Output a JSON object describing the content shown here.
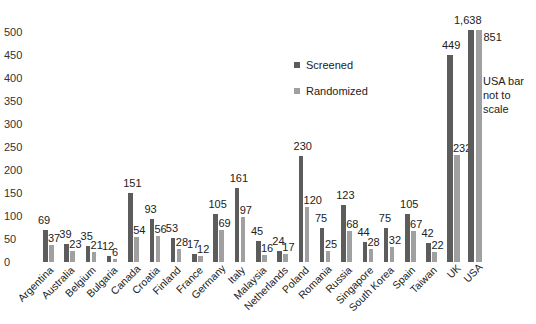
{
  "chart_data": {
    "type": "bar",
    "title": "",
    "xlabel": "",
    "ylabel": "",
    "ylim": [
      0,
      500
    ],
    "yticks": [
      0,
      50,
      100,
      150,
      200,
      250,
      300,
      350,
      400,
      450,
      500
    ],
    "grid": false,
    "legend_position": "upper center",
    "categories": [
      "Argentina",
      "Australia",
      "Belgium",
      "Bulgaria",
      "Canada",
      "Croatia",
      "Finland",
      "France",
      "Germany",
      "Italy",
      "Malaysia",
      "Netherlands",
      "Poland",
      "Romania",
      "Russia",
      "Singapore",
      "South Korea",
      "Spain",
      "Taiwan",
      "UK",
      "USA"
    ],
    "series": [
      {
        "name": "Screened",
        "color": "#5c5c5c",
        "values": [
          69,
          39,
          35,
          12,
          151,
          93,
          53,
          17,
          105,
          161,
          45,
          24,
          230,
          75,
          123,
          44,
          75,
          105,
          42,
          449,
          1638
        ],
        "labels": [
          "69",
          "39",
          "35",
          "12",
          "151",
          "93",
          "53",
          "17",
          "105",
          "161",
          "45",
          "24",
          "230",
          "75",
          "123",
          "44",
          "75",
          "105",
          "42",
          "449",
          "1,638"
        ]
      },
      {
        "name": "Randomized",
        "color": "#a0a0a0",
        "values": [
          37,
          23,
          21,
          6,
          54,
          56,
          28,
          12,
          69,
          97,
          16,
          17,
          120,
          25,
          68,
          28,
          32,
          67,
          22,
          232,
          851
        ],
        "labels": [
          "37",
          "23",
          "21",
          "6",
          "54",
          "56",
          "28",
          "12",
          "69",
          "97",
          "16",
          "17",
          "120",
          "25",
          "68",
          "28",
          "32",
          "67",
          "22",
          "232",
          "851"
        ]
      }
    ],
    "annotations": [
      "USA bar not to scale"
    ]
  },
  "legend": {
    "screened": "Screened",
    "randomized": "Randomized"
  },
  "note": {
    "line1": "USA bar",
    "line2": "not to",
    "line3": "scale"
  }
}
